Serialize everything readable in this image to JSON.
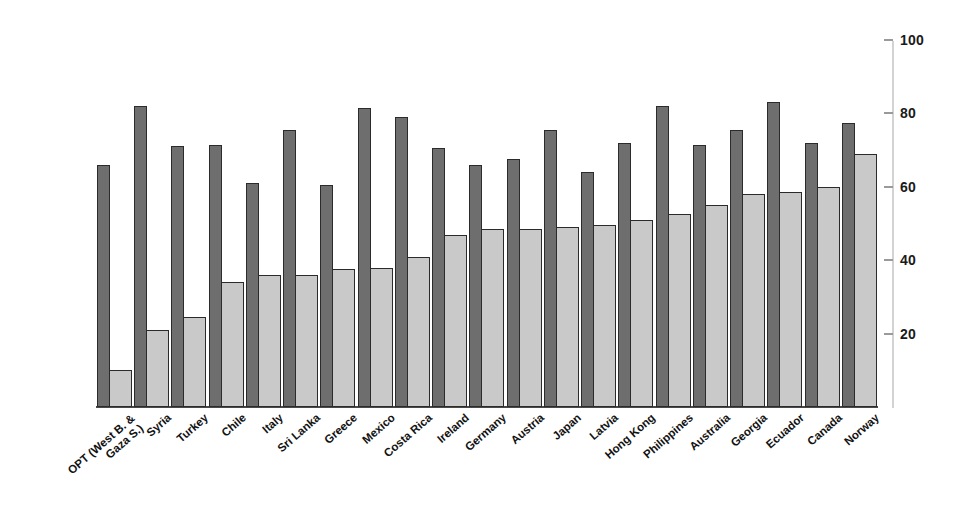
{
  "chart_data": {
    "type": "bar",
    "title": "",
    "subtitle": "",
    "xlabel": "",
    "ylabel": "",
    "ylim": [
      0,
      100
    ],
    "yticks": [
      20,
      40,
      60,
      80,
      100
    ],
    "grid": false,
    "legend_position": "none",
    "axis_side": "right",
    "categories": [
      "OPT (West B. &\nGaza S.)",
      "Syria",
      "Turkey",
      "Chile",
      "Italy",
      "Sri Lanka",
      "Greece",
      "Mexico",
      "Costa Rica",
      "Ireland",
      "Germany",
      "Austria",
      "Japan",
      "Latvia",
      "Hong Kong",
      "Philippines",
      "Australia",
      "Georgia",
      "Ecuador",
      "Canada",
      "Norway"
    ],
    "series": [
      {
        "name": "dark-series",
        "color": "#6e6e6e",
        "values": [
          66,
          82,
          71,
          71.5,
          61,
          75.5,
          60.5,
          81.5,
          79,
          70.5,
          66,
          67.5,
          75.5,
          64,
          72,
          82,
          71.5,
          75.5,
          83,
          72,
          77.5
        ]
      },
      {
        "name": "light-series",
        "color": "#c9c9c9",
        "values": [
          10,
          21,
          24.5,
          34,
          36,
          36,
          37.5,
          38,
          41,
          47,
          48.5,
          48.5,
          49,
          49.5,
          51,
          52.5,
          55,
          58,
          58.5,
          60,
          69
        ]
      }
    ]
  },
  "colors": {
    "dark_bar": "#6e6e6e",
    "light_bar": "#c9c9c9",
    "bar_outline": "#2b2b2b",
    "axis_line": "#d3d3d3",
    "tick": "#9a9a9a",
    "text": "#121212",
    "background": "#ffffff"
  }
}
